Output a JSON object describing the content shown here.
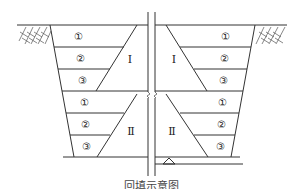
{
  "figure": {
    "caption": "回填示意图",
    "layer_labels": [
      "①",
      "②",
      "③",
      "①",
      "②",
      "③"
    ],
    "zones": {
      "upper": "Ⅰ",
      "lower": "Ⅱ"
    },
    "colors": {
      "line": "#333333",
      "background": "#ffffff"
    }
  }
}
